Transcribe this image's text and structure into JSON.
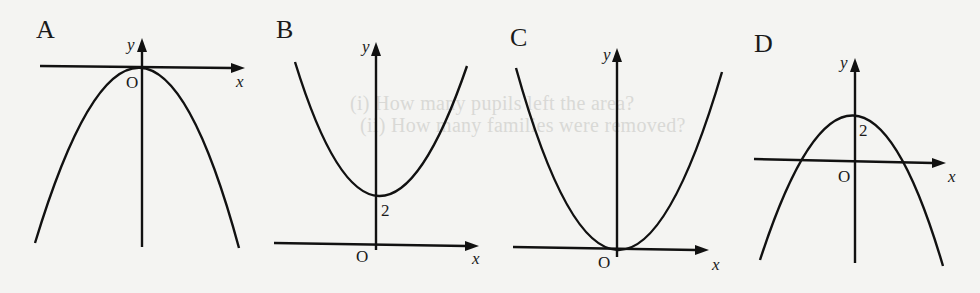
{
  "background_bleed_text": [
    "(i)  How many pupils left the area?",
    "(ii)  How many families were removed?"
  ],
  "panels": [
    {
      "label": "A",
      "description": "Downward-opening parabola with vertex at the origin",
      "axis_x": "x",
      "axis_y": "y",
      "origin": "O",
      "vertex_label": ""
    },
    {
      "label": "B",
      "description": "Upward-opening parabola with vertex at (0, 2)",
      "axis_x": "x",
      "axis_y": "y",
      "origin": "O",
      "vertex_label": "2"
    },
    {
      "label": "C",
      "description": "Upward-opening parabola with vertex at the origin",
      "axis_x": "x",
      "axis_y": "y",
      "origin": "O",
      "vertex_label": ""
    },
    {
      "label": "D",
      "description": "Downward-opening parabola with vertex at (0, 2)",
      "axis_x": "x",
      "axis_y": "y",
      "origin": "O",
      "vertex_label": "2"
    }
  ],
  "colors": {
    "ink": "#111111",
    "paper": "#f4f4f2"
  }
}
